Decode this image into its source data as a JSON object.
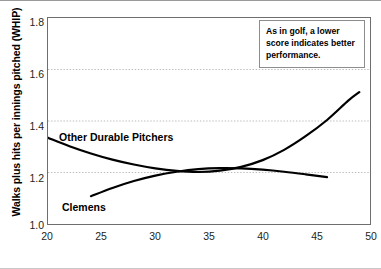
{
  "chart_data": {
    "type": "line",
    "title": "",
    "xlabel": "Pitcher's Age",
    "ylabel": "Walks plus hits per innings pitched (WHIP)",
    "xlim": [
      20,
      50
    ],
    "ylim": [
      1.0,
      1.8
    ],
    "xticks": [
      "20",
      "25",
      "30",
      "35",
      "40",
      "45",
      "50"
    ],
    "yticks": [
      "1.0",
      "1.2",
      "1.4",
      "1.6",
      "1.8"
    ],
    "grid": "horizontal-dotted",
    "legend_position": "inline-labels",
    "series": [
      {
        "name": "Other Durable Pitchers",
        "x": [
          20,
          22,
          24,
          26,
          28,
          30,
          32,
          34,
          36,
          38,
          40,
          42,
          44,
          46,
          48,
          49
        ],
        "values": [
          1.335,
          1.302,
          1.274,
          1.25,
          1.231,
          1.216,
          1.206,
          1.202,
          1.207,
          1.222,
          1.248,
          1.288,
          1.341,
          1.404,
          1.48,
          1.512
        ]
      },
      {
        "name": "Clemens",
        "x": [
          24,
          26,
          28,
          30,
          32,
          34,
          36,
          38,
          40,
          42,
          44,
          46
        ],
        "values": [
          1.108,
          1.14,
          1.167,
          1.188,
          1.203,
          1.213,
          1.217,
          1.216,
          1.211,
          1.203,
          1.193,
          1.182
        ]
      }
    ],
    "annotations": [
      {
        "name": "golf-note",
        "text": "As in golf, a lower score indicates better performance."
      }
    ]
  },
  "axis": {
    "y_title": "Walks plus hits per innings pitched (WHIP)",
    "x_title": "Pitcher's Age"
  },
  "labels": {
    "other": "Other Durable Pitchers",
    "clemens": "Clemens"
  },
  "annotation": {
    "text": "As in golf, a lower score indicates better performance."
  },
  "colors": {
    "line": "#000000",
    "grid": "#b4b4b4",
    "frame": "#6e6e6e",
    "text": "#231f20",
    "background": "#ffffff"
  }
}
